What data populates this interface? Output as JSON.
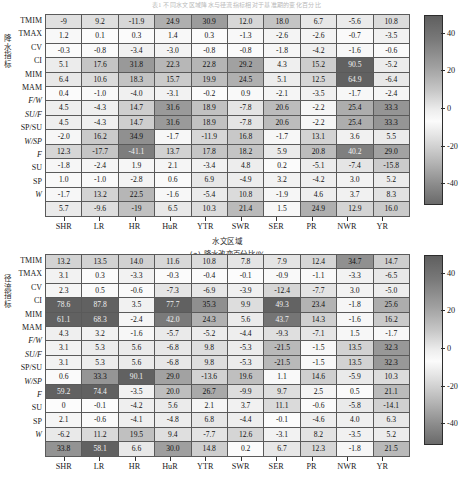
{
  "top_caption": "表1  不同水文区域降水与径流指标相对于基准期的变化百分比",
  "panels": [
    {
      "id": "a",
      "caption": "(a) 降水改变百分比/%",
      "y_axis_title": "降水指标",
      "x_axis_title": "水文区域",
      "row_labels": [
        "TMIM",
        "TMAX",
        "CV",
        "CI",
        "MIM",
        "MAM",
        "F/W",
        "SU/F",
        "SP/SU",
        "W/SP",
        "F",
        "SU",
        "SP",
        "W"
      ],
      "row_italic": [
        false,
        false,
        false,
        false,
        false,
        false,
        true,
        true,
        false,
        true,
        true,
        false,
        false,
        true
      ],
      "col_labels": [
        "SHR",
        "LR",
        "HR",
        "HuR",
        "YTR",
        "SWR",
        "SER",
        "PR",
        "NWR",
        "YR"
      ],
      "values": [
        [
          "-9",
          "9.2",
          "-11.9",
          "24.9",
          "30.9",
          "12.0",
          "18.0",
          "6.7",
          "-5.6",
          "10.8"
        ],
        [
          "1.2",
          "0.1",
          "0.3",
          "1.4",
          "0.3",
          "-1.3",
          "-2.6",
          "-2.6",
          "-0.7",
          "-3.5"
        ],
        [
          "-0.3",
          "-0.8",
          "-3.4",
          "-3.0",
          "-0.8",
          "-0.8",
          "-1.8",
          "-4.2",
          "-1.6",
          "-0.6"
        ],
        [
          "5.1",
          "17.6",
          "31.8",
          "22.3",
          "22.8",
          "29.2",
          "4.3",
          "15.2",
          "90.5",
          "-5.2"
        ],
        [
          "6.4",
          "10.6",
          "18.3",
          "15.7",
          "19.9",
          "24.5",
          "5.1",
          "12.5",
          "64.9",
          "-6.4"
        ],
        [
          "0.4",
          "-1.0",
          "-4.0",
          "-3.1",
          "-0.2",
          "0.9",
          "-2.1",
          "-3.5",
          "-1.7",
          "-2.4"
        ],
        [
          "4.5",
          "-4.3",
          "14.7",
          "31.6",
          "18.9",
          "-7.8",
          "20.6",
          "-2.2",
          "25.4",
          "33.3"
        ],
        [
          "4.5",
          "-4.3",
          "14.7",
          "31.6",
          "18.9",
          "-7.8",
          "20.6",
          "-2.2",
          "25.4",
          "33.3"
        ],
        [
          "-2.0",
          "16.2",
          "34.9",
          "-1.7",
          "-11.9",
          "16.8",
          "-1.7",
          "13.1",
          "3.6",
          "5.5"
        ],
        [
          "12.3",
          "-17.7",
          "-41.1",
          "13.7",
          "17.8",
          "18.2",
          "5.9",
          "20.8",
          "40.2",
          "29.0"
        ],
        [
          "-1.8",
          "-2.4",
          "1.9",
          "2.1",
          "-3.4",
          "4.8",
          "0.2",
          "-5.1",
          "-7.4",
          "-15.8"
        ],
        [
          "1.0",
          "-1.0",
          "-2.8",
          "0.6",
          "6.9",
          "-4.9",
          "3.2",
          "-4.2",
          "3.0",
          "5.2"
        ],
        [
          "-1.7",
          "13.2",
          "22.5",
          "-1.6",
          "-5.4",
          "10.8",
          "-1.9",
          "4.6",
          "3.7",
          "8.3"
        ],
        [
          "5.7",
          "-9.6",
          "-19",
          "6.5",
          "10.3",
          "21.4",
          "1.5",
          "24.9",
          "12.9",
          "16.0"
        ]
      ],
      "numeric": [
        [
          -9,
          9.2,
          -11.9,
          24.9,
          30.9,
          12.0,
          18.0,
          6.7,
          -5.6,
          10.8
        ],
        [
          1.2,
          0.1,
          0.3,
          1.4,
          0.3,
          -1.3,
          -2.6,
          -2.6,
          -0.7,
          -3.5
        ],
        [
          -0.3,
          -0.8,
          -3.4,
          -3.0,
          -0.8,
          -0.8,
          -1.8,
          -4.2,
          -1.6,
          -0.6
        ],
        [
          5.1,
          17.6,
          31.8,
          22.3,
          22.8,
          29.2,
          4.3,
          15.2,
          90.5,
          -5.2
        ],
        [
          6.4,
          10.6,
          18.3,
          15.7,
          19.9,
          24.5,
          5.1,
          12.5,
          64.9,
          -6.4
        ],
        [
          0.4,
          -1.0,
          -4.0,
          -3.1,
          -0.2,
          0.9,
          -2.1,
          -3.5,
          -1.7,
          -2.4
        ],
        [
          4.5,
          -4.3,
          14.7,
          31.6,
          18.9,
          -7.8,
          20.6,
          -2.2,
          25.4,
          33.3
        ],
        [
          4.5,
          -4.3,
          14.7,
          31.6,
          18.9,
          -7.8,
          20.6,
          -2.2,
          25.4,
          33.3
        ],
        [
          -2.0,
          16.2,
          34.9,
          -1.7,
          -11.9,
          16.8,
          -1.7,
          13.1,
          3.6,
          5.5
        ],
        [
          12.3,
          -17.7,
          -41.1,
          13.7,
          17.8,
          18.2,
          5.9,
          20.8,
          40.2,
          29.0
        ],
        [
          -1.8,
          -2.4,
          1.9,
          2.1,
          -3.4,
          4.8,
          0.2,
          -5.1,
          -7.4,
          -15.8
        ],
        [
          1.0,
          -1.0,
          -2.8,
          0.6,
          6.9,
          -4.9,
          3.2,
          -4.2,
          3.0,
          5.2
        ],
        [
          -1.7,
          13.2,
          22.5,
          -1.6,
          -5.4,
          10.8,
          -1.9,
          4.6,
          3.7,
          8.3
        ],
        [
          5.7,
          -9.6,
          -19,
          6.5,
          10.3,
          21.4,
          1.5,
          24.9,
          12.9,
          16.0
        ]
      ]
    },
    {
      "id": "b",
      "caption": "",
      "y_axis_title": "径流指标",
      "x_axis_title": "",
      "row_labels": [
        "TMIM",
        "TMAX",
        "CV",
        "CI",
        "MIM",
        "MAM",
        "F/W",
        "SU/F",
        "SP/SU",
        "W/SP",
        "F",
        "SU",
        "SP",
        "W"
      ],
      "row_italic": [
        false,
        false,
        false,
        false,
        false,
        false,
        true,
        true,
        false,
        true,
        true,
        false,
        false,
        true
      ],
      "col_labels": [
        "SHR",
        "LR",
        "HR",
        "HuR",
        "YTR",
        "SWR",
        "SER",
        "PR",
        "NWR",
        "YR"
      ],
      "values": [
        [
          "13.2",
          "13.5",
          "14.0",
          "11.6",
          "10.8",
          "7.8",
          "7.9",
          "12.4",
          "34.7",
          "14.7"
        ],
        [
          "3.1",
          "0.3",
          "-3.3",
          "-0.3",
          "-0.4",
          "-0.1",
          "-0.9",
          "-1.1",
          "-3.3",
          "-6.5"
        ],
        [
          "2.3",
          "0.5",
          "-0.6",
          "-7.3",
          "-6.9",
          "-3.9",
          "-12.4",
          "-7.7",
          "3.0",
          "-5.0"
        ],
        [
          "78.6",
          "87.8",
          "3.5",
          "77.7",
          "35.3",
          "9.9",
          "49.3",
          "23.4",
          "-1.8",
          "25.6"
        ],
        [
          "61.1",
          "68.3",
          "-2.4",
          "42.0",
          "24.3",
          "5.6",
          "43.7",
          "14.3",
          "-1.6",
          "16.2"
        ],
        [
          "4.3",
          "3.2",
          "-1.6",
          "-5.7",
          "-5.2",
          "-4.4",
          "-9.3",
          "-7.1",
          "1.5",
          "-1.7"
        ],
        [
          "3.1",
          "5.3",
          "5.6",
          "-6.8",
          "9.8",
          "-5.3",
          "-21.5",
          "-1.5",
          "13.5",
          "32.3"
        ],
        [
          "3.1",
          "5.3",
          "5.6",
          "-6.8",
          "9.8",
          "-5.3",
          "-21.5",
          "-1.5",
          "13.5",
          "32.3"
        ],
        [
          "0.6",
          "33.3",
          "90.1",
          "29.0",
          "-13.6",
          "19.6",
          "1.1",
          "14.6",
          "-5.9",
          "10.3"
        ],
        [
          "59.2",
          "74.4",
          "-3.5",
          "20.0",
          "26.7",
          "-9.9",
          "9.7",
          "2.5",
          "0.5",
          "21.1"
        ],
        [
          "0",
          "-0.1",
          "-4.2",
          "5.6",
          "2.1",
          "3.7",
          "11.1",
          "-0.6",
          "-5.8",
          "-14.1"
        ],
        [
          "2.1",
          "-0.6",
          "-4.1",
          "-4.8",
          "6.8",
          "-4.4",
          "-0.1",
          "-4.6",
          "4.0",
          "6.3"
        ],
        [
          "-6.2",
          "11.2",
          "19.5",
          "9.4",
          "-7.7",
          "12.6",
          "-3.1",
          "8.2",
          "-3.5",
          "5.2"
        ],
        [
          "33.8",
          "58.1",
          "6.6",
          "30.0",
          "14.8",
          "0.2",
          "6.7",
          "12.3",
          "-1.8",
          "21.5"
        ]
      ],
      "numeric": [
        [
          13.2,
          13.5,
          14.0,
          11.6,
          10.8,
          7.8,
          7.9,
          12.4,
          34.7,
          14.7
        ],
        [
          3.1,
          0.3,
          -3.3,
          -0.3,
          -0.4,
          -0.1,
          -0.9,
          -1.1,
          -3.3,
          -6.5
        ],
        [
          2.3,
          0.5,
          -0.6,
          -7.3,
          -6.9,
          -3.9,
          -12.4,
          -7.7,
          3.0,
          -5.0
        ],
        [
          78.6,
          87.8,
          3.5,
          77.7,
          35.3,
          9.9,
          49.3,
          23.4,
          -1.8,
          25.6
        ],
        [
          61.1,
          68.3,
          -2.4,
          42.0,
          24.3,
          5.6,
          43.7,
          14.3,
          -1.6,
          16.2
        ],
        [
          4.3,
          3.2,
          -1.6,
          -5.7,
          -5.2,
          -4.4,
          -9.3,
          -7.1,
          1.5,
          -1.7
        ],
        [
          3.1,
          5.3,
          5.6,
          -6.8,
          9.8,
          -5.3,
          -21.5,
          -1.5,
          13.5,
          32.3
        ],
        [
          3.1,
          5.3,
          5.6,
          -6.8,
          9.8,
          -5.3,
          -21.5,
          -1.5,
          13.5,
          32.3
        ],
        [
          0.6,
          33.3,
          90.1,
          29.0,
          -13.6,
          19.6,
          1.1,
          14.6,
          -5.9,
          10.3
        ],
        [
          59.2,
          74.4,
          -3.5,
          20.0,
          26.7,
          -9.9,
          9.7,
          2.5,
          0.5,
          21.1
        ],
        [
          0,
          -0.1,
          -4.2,
          5.6,
          2.1,
          3.7,
          11.1,
          -0.6,
          -5.8,
          -14.1
        ],
        [
          2.1,
          -0.6,
          -4.1,
          -4.8,
          6.8,
          -4.4,
          -0.1,
          -4.6,
          4.0,
          6.3
        ],
        [
          -6.2,
          11.2,
          19.5,
          9.4,
          -7.7,
          12.6,
          -3.1,
          8.2,
          -3.5,
          5.2
        ],
        [
          33.8,
          58.1,
          6.6,
          30.0,
          14.8,
          0.2,
          6.7,
          12.3,
          -1.8,
          21.5
        ]
      ]
    }
  ],
  "colorbar": {
    "ticks": [
      "40",
      "20",
      "0",
      "-20",
      "-40"
    ],
    "tick_values": [
      40,
      20,
      0,
      -20,
      -40
    ],
    "vmin": -50,
    "vmax": 50
  },
  "chart_data": {
    "type": "heatmap",
    "title": "表1  不同水文区域降水与径流指标相对于基准期的变化百分比",
    "xlabel": "水文区域",
    "grid": true,
    "legend_position": "right",
    "colorbar_range": [
      -50,
      50
    ],
    "colorbar_ticks": [
      -40,
      -20,
      0,
      20,
      40
    ],
    "panels": [
      {
        "name": "(a) 降水改变百分比/%",
        "ylabel": "降水指标",
        "xlabel": "水文区域",
        "x": [
          "SHR",
          "LR",
          "HR",
          "HuR",
          "YTR",
          "SWR",
          "SER",
          "PR",
          "NWR",
          "YR"
        ],
        "y": [
          "TMIM",
          "TMAX",
          "CV",
          "CI",
          "MIM",
          "MAM",
          "F/W",
          "SU/F",
          "SP/SU",
          "W/SP",
          "F",
          "SU",
          "SP",
          "W"
        ],
        "z": [
          [
            -9,
            9.2,
            -11.9,
            24.9,
            30.9,
            12.0,
            18.0,
            6.7,
            -5.6,
            10.8
          ],
          [
            1.2,
            0.1,
            0.3,
            1.4,
            0.3,
            -1.3,
            -2.6,
            -2.6,
            -0.7,
            -3.5
          ],
          [
            -0.3,
            -0.8,
            -3.4,
            -3.0,
            -0.8,
            -0.8,
            -1.8,
            -4.2,
            -1.6,
            -0.6
          ],
          [
            5.1,
            17.6,
            31.8,
            22.3,
            22.8,
            29.2,
            4.3,
            15.2,
            90.5,
            -5.2
          ],
          [
            6.4,
            10.6,
            18.3,
            15.7,
            19.9,
            24.5,
            5.1,
            12.5,
            64.9,
            -6.4
          ],
          [
            0.4,
            -1.0,
            -4.0,
            -3.1,
            -0.2,
            0.9,
            -2.1,
            -3.5,
            -1.7,
            -2.4
          ],
          [
            4.5,
            -4.3,
            14.7,
            31.6,
            18.9,
            -7.8,
            20.6,
            -2.2,
            25.4,
            33.3
          ],
          [
            4.5,
            -4.3,
            14.7,
            31.6,
            18.9,
            -7.8,
            20.6,
            -2.2,
            25.4,
            33.3
          ],
          [
            -2.0,
            16.2,
            34.9,
            -1.7,
            -11.9,
            16.8,
            -1.7,
            13.1,
            3.6,
            5.5
          ],
          [
            12.3,
            -17.7,
            -41.1,
            13.7,
            17.8,
            18.2,
            5.9,
            20.8,
            40.2,
            29.0
          ],
          [
            -1.8,
            -2.4,
            1.9,
            2.1,
            -3.4,
            4.8,
            0.2,
            -5.1,
            -7.4,
            -15.8
          ],
          [
            1.0,
            -1.0,
            -2.8,
            0.6,
            6.9,
            -4.9,
            3.2,
            -4.2,
            3.0,
            5.2
          ],
          [
            -1.7,
            13.2,
            22.5,
            -1.6,
            -5.4,
            10.8,
            -1.9,
            4.6,
            3.7,
            8.3
          ],
          [
            5.7,
            -9.6,
            -19,
            6.5,
            10.3,
            21.4,
            1.5,
            24.9,
            12.9,
            16.0
          ]
        ]
      },
      {
        "name": "(b) 径流改变百分比/%",
        "ylabel": "径流指标",
        "xlabel": "水文区域",
        "x": [
          "SHR",
          "LR",
          "HR",
          "HuR",
          "YTR",
          "SWR",
          "SER",
          "PR",
          "NWR",
          "YR"
        ],
        "y": [
          "TMIM",
          "TMAX",
          "CV",
          "CI",
          "MIM",
          "MAM",
          "F/W",
          "SU/F",
          "SP/SU",
          "W/SP",
          "F",
          "SU",
          "SP",
          "W"
        ],
        "z": [
          [
            13.2,
            13.5,
            14.0,
            11.6,
            10.8,
            7.8,
            7.9,
            12.4,
            34.7,
            14.7
          ],
          [
            3.1,
            0.3,
            -3.3,
            -0.3,
            -0.4,
            -0.1,
            -0.9,
            -1.1,
            -3.3,
            -6.5
          ],
          [
            2.3,
            0.5,
            -0.6,
            -7.3,
            -6.9,
            -3.9,
            -12.4,
            -7.7,
            3.0,
            -5.0
          ],
          [
            78.6,
            87.8,
            3.5,
            77.7,
            35.3,
            9.9,
            49.3,
            23.4,
            -1.8,
            25.6
          ],
          [
            61.1,
            68.3,
            -2.4,
            42.0,
            24.3,
            5.6,
            43.7,
            14.3,
            -1.6,
            16.2
          ],
          [
            4.3,
            3.2,
            -1.6,
            -5.7,
            -5.2,
            -4.4,
            -9.3,
            -7.1,
            1.5,
            -1.7
          ],
          [
            3.1,
            5.3,
            5.6,
            -6.8,
            9.8,
            -5.3,
            -21.5,
            -1.5,
            13.5,
            32.3
          ],
          [
            3.1,
            5.3,
            5.6,
            -6.8,
            9.8,
            -5.3,
            -21.5,
            -1.5,
            13.5,
            32.3
          ],
          [
            0.6,
            33.3,
            90.1,
            29.0,
            -13.6,
            19.6,
            1.1,
            14.6,
            -5.9,
            10.3
          ],
          [
            59.2,
            74.4,
            -3.5,
            20.0,
            26.7,
            -9.9,
            9.7,
            2.5,
            0.5,
            21.1
          ],
          [
            0,
            -0.1,
            -4.2,
            5.6,
            2.1,
            3.7,
            11.1,
            -0.6,
            -5.8,
            -14.1
          ],
          [
            2.1,
            -0.6,
            -4.1,
            -4.8,
            6.8,
            -4.4,
            -0.1,
            -4.6,
            4.0,
            6.3
          ],
          [
            -6.2,
            11.2,
            19.5,
            9.4,
            -7.7,
            12.6,
            -3.1,
            8.2,
            -3.5,
            5.2
          ],
          [
            33.8,
            58.1,
            6.6,
            30.0,
            14.8,
            0.2,
            6.7,
            12.3,
            -1.8,
            21.5
          ]
        ]
      }
    ]
  }
}
